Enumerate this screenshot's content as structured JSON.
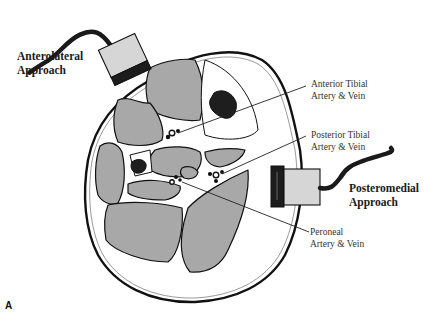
{
  "figure": {
    "panel_letter": "A",
    "colors": {
      "muscle_fill": "#a8a8a8",
      "bone_fill": "#1e1e1e",
      "outline": "#111111",
      "probe_body": "#d6d6d6",
      "probe_band": "#1c1c1c",
      "background": "#ffffff"
    }
  },
  "labels": {
    "anterolateral": {
      "line1": "Anterolateral",
      "line2": "Approach"
    },
    "posteromedial": {
      "line1": "Posteromedial",
      "line2": "Approach"
    },
    "anterior_tibial": {
      "line1": "Anterior Tibial",
      "line2": "Artery & Vein"
    },
    "posterior_tibial": {
      "line1": "Posterior Tibial",
      "line2": "Artery & Vein"
    },
    "peroneal": {
      "line1": "Peroneal",
      "line2": "Artery & Vein"
    }
  }
}
